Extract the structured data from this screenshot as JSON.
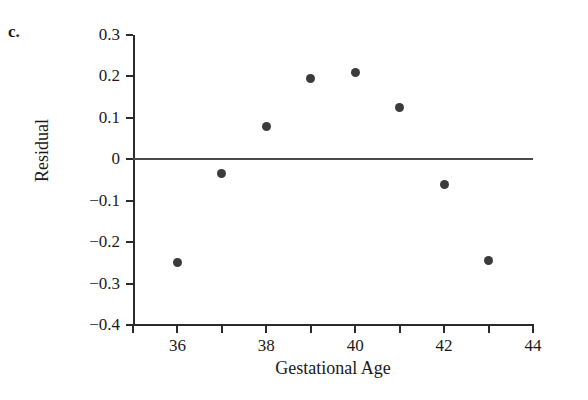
{
  "panel": {
    "label": "c."
  },
  "chart_data": {
    "type": "scatter",
    "title": "",
    "xlabel": "Gestational Age",
    "ylabel": "Residual",
    "x": [
      36,
      37,
      38,
      39,
      40,
      41,
      42,
      43
    ],
    "values": [
      -0.25,
      -0.035,
      0.08,
      0.195,
      0.21,
      0.125,
      -0.06,
      -0.245
    ],
    "points": [
      {
        "x": 36,
        "y": -0.25
      },
      {
        "x": 37,
        "y": -0.035
      },
      {
        "x": 38,
        "y": 0.08
      },
      {
        "x": 39,
        "y": 0.195
      },
      {
        "x": 40,
        "y": 0.21
      },
      {
        "x": 41,
        "y": 0.125
      },
      {
        "x": 42,
        "y": -0.06
      },
      {
        "x": 43,
        "y": -0.245
      }
    ],
    "xlim": [
      35,
      44
    ],
    "ylim": [
      -0.4,
      0.3
    ],
    "xticks": [
      35,
      36,
      37,
      38,
      39,
      40,
      41,
      42,
      43,
      44
    ],
    "xtick_labels": [
      "",
      "36",
      "",
      "38",
      "",
      "40",
      "",
      "42",
      "",
      "44"
    ],
    "yticks": [
      0.3,
      0.2,
      0.1,
      0,
      -0.1,
      -0.2,
      -0.3,
      -0.4
    ],
    "ytick_labels": [
      "0.3",
      "0.2",
      "0.1",
      "0",
      "−0.1",
      "−0.2",
      "−0.3",
      "−0.4"
    ],
    "grid": false,
    "legend": null,
    "reference_lines": [
      {
        "orientation": "horizontal",
        "value": 0,
        "color": "#4a4a4a"
      }
    ],
    "marker_color": "#3b3b3b",
    "axis_color": "#2b2b2b"
  }
}
